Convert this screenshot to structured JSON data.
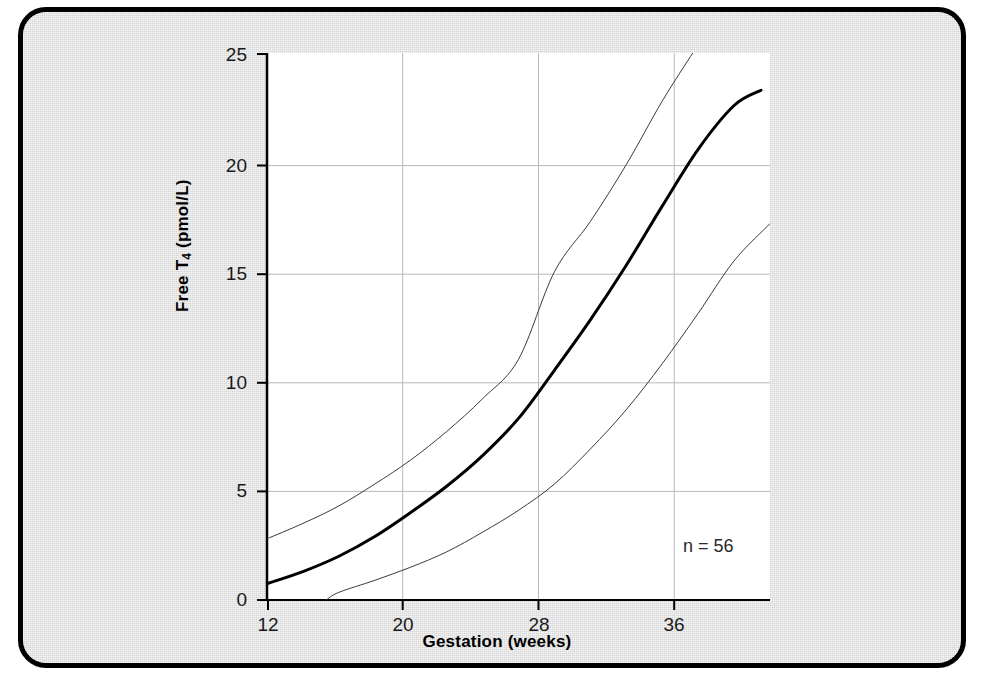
{
  "figure": {
    "background_color": "#dcdcdc",
    "frame_color": "#000000",
    "plot_background_color": "#ffffff"
  },
  "annotation": {
    "sample_size_label": "n = 56"
  },
  "chart_data": {
    "type": "line",
    "title": "",
    "xlabel": "Gestation (weeks)",
    "ylabel": "Free T4 (pmol/L)",
    "ylabel_parts": {
      "prefix": "Free T",
      "subscript": "4",
      "suffix": " (pmol/L)"
    },
    "xlim": [
      12,
      40
    ],
    "ylim": [
      0,
      25
    ],
    "xticks": [
      12,
      20,
      28,
      36
    ],
    "yticks": [
      0,
      5,
      10,
      15,
      20,
      25
    ],
    "xtick_labels": [
      "12",
      "20",
      "28",
      "36"
    ],
    "ytick_labels": [
      "0",
      "5",
      "10",
      "15",
      "20",
      "25"
    ],
    "grid": true,
    "grid_color": "#b5b5b5",
    "legend": "none",
    "annotations": [
      {
        "text": "n = 56",
        "x": 36.5,
        "y": 6.5
      }
    ],
    "series": [
      {
        "name": "upper reference limit",
        "style": "thin",
        "color": "#3a3a3a",
        "linewidth": 1,
        "x": [
          12,
          14,
          16,
          18,
          20,
          22,
          24,
          26,
          28,
          30,
          32,
          34,
          35.7
        ],
        "y": [
          2.8,
          3.5,
          4.3,
          5.3,
          6.4,
          7.7,
          9.2,
          11.0,
          15.0,
          17.3,
          19.9,
          22.8,
          25.0
        ]
      },
      {
        "name": "median",
        "style": "bold",
        "color": "#000000",
        "linewidth": 3,
        "x": [
          12,
          14,
          16,
          18,
          20,
          22,
          24,
          26,
          28,
          30,
          32,
          34,
          36,
          38,
          39.5
        ],
        "y": [
          0.75,
          1.3,
          2.0,
          2.9,
          4.0,
          5.2,
          6.6,
          8.3,
          10.5,
          12.8,
          15.3,
          18.0,
          20.6,
          22.6,
          23.3
        ]
      },
      {
        "name": "lower reference limit",
        "style": "thin",
        "color": "#3a3a3a",
        "linewidth": 1,
        "x": [
          15.3,
          16,
          18,
          20,
          22,
          24,
          26,
          28,
          30,
          32,
          34,
          36,
          38,
          40
        ],
        "y": [
          0.0,
          0.35,
          0.9,
          1.5,
          2.2,
          3.1,
          4.1,
          5.3,
          6.9,
          8.7,
          10.8,
          13.1,
          15.5,
          17.2
        ]
      }
    ]
  },
  "axes_geometry": {
    "plot_left_px": 244,
    "plot_right_px": 747,
    "plot_top_px": 41,
    "plot_bottom_px": 588,
    "x_gridlines_px": [
      244,
      380,
      515,
      651
    ],
    "y_gridlines_px": [
      588,
      479,
      371,
      262,
      154,
      41
    ]
  }
}
